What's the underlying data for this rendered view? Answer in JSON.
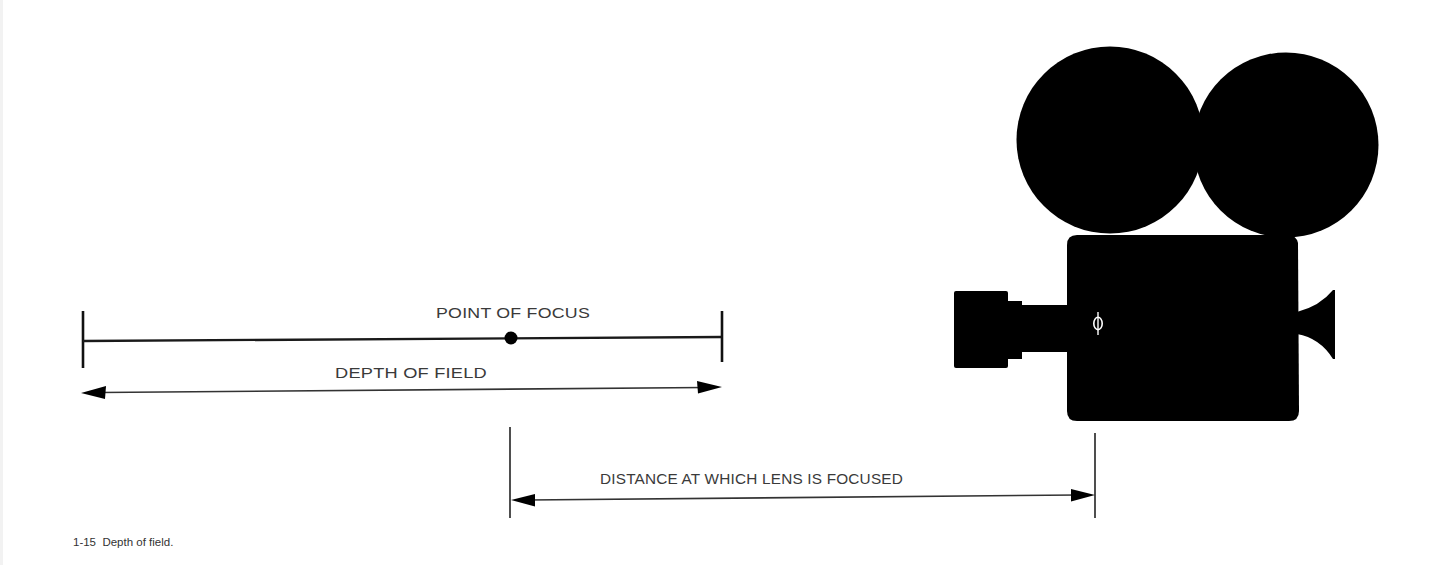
{
  "figure": {
    "number": "1-15",
    "title": "Depth of field.",
    "caption": "1-15  Depth of field."
  },
  "labels": {
    "point_of_focus": "POINT OF FOCUS",
    "depth_of_field": "DEPTH OF FIELD",
    "focus_distance": "DISTANCE AT WHICH LENS IS FOCUSED"
  },
  "symbols": {
    "focus_mark": "phi"
  },
  "colors": {
    "ink": "#000000",
    "text": "#3a3a3a",
    "background": "#ffffff"
  }
}
